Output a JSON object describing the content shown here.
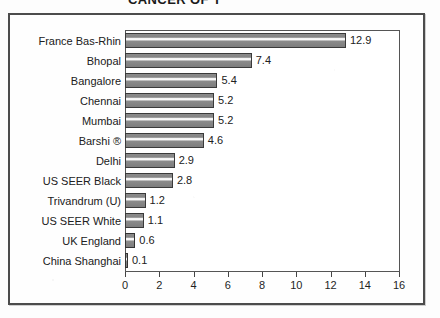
{
  "chart_data": {
    "type": "bar",
    "orientation": "horizontal",
    "title": "",
    "xlabel": "",
    "ylabel": "",
    "xlim": [
      0,
      16
    ],
    "xticks": [
      0,
      2,
      4,
      6,
      8,
      10,
      12,
      14,
      16
    ],
    "xtick_labels": [
      "0",
      "2",
      "4",
      "6",
      "8",
      "10",
      "12",
      "14",
      "16"
    ],
    "grid": false,
    "legend": false,
    "categories": [
      "France Bas-Rhin",
      "Bhopal",
      "Bangalore",
      "Chennai",
      "Mumbai",
      "Barshi ®",
      "Delhi",
      "US SEER Black",
      "Trivandrum (U)",
      "US SEER White",
      "UK England",
      "China Shanghai"
    ],
    "values": [
      12.9,
      7.4,
      5.4,
      5.2,
      5.2,
      4.6,
      2.9,
      2.8,
      1.2,
      1.1,
      0.6,
      0.1
    ],
    "value_labels": [
      "12.9",
      "7.4",
      "5.4",
      "5.2",
      "5.2",
      "4.6",
      "2.9",
      "2.8",
      "1.2",
      "1.1",
      "0.6",
      "0.1"
    ],
    "colors": {
      "bar_fill": "#808080",
      "bar_outline": "#3a3a3a",
      "bar_highlight": "#f5f5f5",
      "plot_background": "#ffffff",
      "page_background": "#fdfdfd",
      "frame": "#4c4c4c",
      "text": "#202020"
    }
  },
  "figure": {
    "title_partial": "CANCER OF T"
  }
}
